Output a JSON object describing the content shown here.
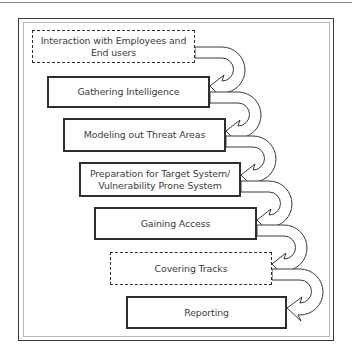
{
  "diagram": {
    "type": "process-flow",
    "connector_style": "curved hollow arrows from each step to the next",
    "steps": [
      {
        "label": "Interaction with Employees and End users",
        "line1": "Interaction with Employees and",
        "line2": "End users",
        "border": "dashed"
      },
      {
        "label": "Gathering Intelligence",
        "border": "solid"
      },
      {
        "label": "Modeling out Threat Areas",
        "border": "solid"
      },
      {
        "label": "Preparation for Target System/ Vulnerability Prone System",
        "line1": "Preparation for Target System/",
        "line2": "Vulnerability Prone System",
        "border": "solid"
      },
      {
        "label": "Gaining Access",
        "border": "solid"
      },
      {
        "label": "Covering Tracks",
        "border": "dashed"
      },
      {
        "label": "Reporting",
        "border": "solid"
      }
    ],
    "edges": [
      {
        "from": 0,
        "to": 1
      },
      {
        "from": 1,
        "to": 2
      },
      {
        "from": 2,
        "to": 3
      },
      {
        "from": 3,
        "to": 4
      },
      {
        "from": 4,
        "to": 5
      },
      {
        "from": 5,
        "to": 6
      }
    ],
    "colors": {
      "line": "#2e2e2e",
      "text": "#3c3c3c",
      "background": "#ffffff"
    }
  }
}
